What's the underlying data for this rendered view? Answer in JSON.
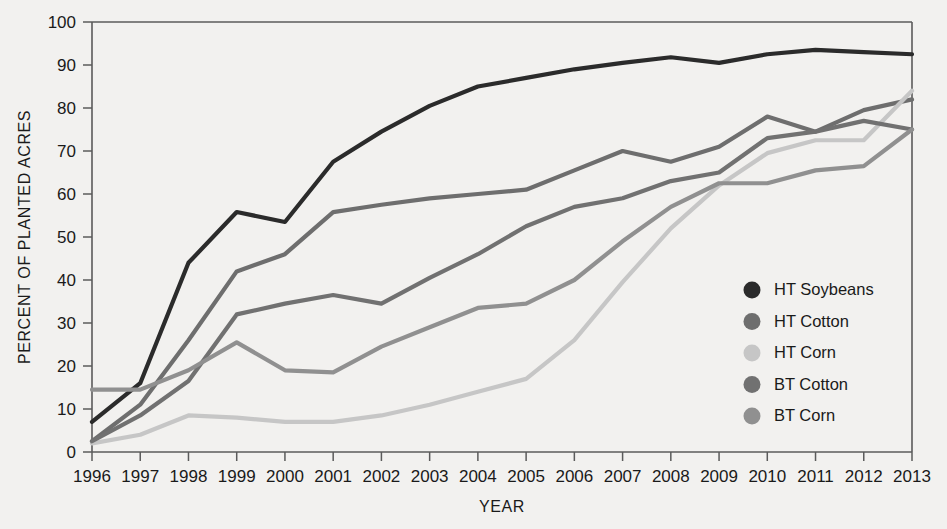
{
  "chart_data": {
    "type": "line",
    "title": "",
    "xlabel": "YEAR",
    "ylabel": "PERCENT OF PLANTED ACRES",
    "xlim": [
      1996,
      2013
    ],
    "ylim": [
      0,
      100
    ],
    "grid": false,
    "legend_position": "inside-right",
    "x": [
      1996,
      1997,
      1998,
      1999,
      2000,
      2001,
      2002,
      2003,
      2004,
      2005,
      2006,
      2007,
      2008,
      2009,
      2010,
      2011,
      2012,
      2013
    ],
    "categories": [
      "1996",
      "1997",
      "1998",
      "1999",
      "2000",
      "2001",
      "2002",
      "2003",
      "2004",
      "2005",
      "2006",
      "2007",
      "2008",
      "2009",
      "2010",
      "2011",
      "2012",
      "2013"
    ],
    "yticks": [
      0,
      10,
      20,
      30,
      40,
      50,
      60,
      70,
      80,
      90,
      100
    ],
    "ytick_labels": [
      "0",
      "10",
      "20",
      "30",
      "40",
      "50",
      "60",
      "70",
      "80",
      "90",
      "100"
    ],
    "series": [
      {
        "name": "HT Soybeans",
        "color": "#2b2b2b",
        "values": [
          7.0,
          16.0,
          44.0,
          55.8,
          53.5,
          67.5,
          74.5,
          80.5,
          85.0,
          87.0,
          89.0,
          90.5,
          91.8,
          90.5,
          92.5,
          93.5,
          93.0,
          92.5
        ]
      },
      {
        "name": "HT Cotton",
        "color": "#6e6e6e",
        "values": [
          2.5,
          11.0,
          26.0,
          42.0,
          46.0,
          55.8,
          57.5,
          59.0,
          60.0,
          61.0,
          65.5,
          70.0,
          67.5,
          71.0,
          78.0,
          74.5,
          79.5,
          82.0
        ]
      },
      {
        "name": "HT Corn",
        "color": "#c6c6c6",
        "values": [
          2.0,
          4.0,
          8.5,
          8.0,
          7.0,
          7.0,
          8.5,
          11.0,
          14.0,
          17.0,
          26.0,
          39.5,
          52.0,
          62.0,
          69.5,
          72.5,
          72.5,
          84.0
        ]
      },
      {
        "name": "BT Cotton",
        "color": "#717171",
        "values": [
          2.5,
          8.5,
          16.5,
          32.0,
          34.5,
          36.5,
          34.5,
          40.5,
          46.0,
          52.5,
          57.0,
          59.0,
          63.0,
          65.0,
          73.0,
          74.5,
          77.0,
          75.0
        ]
      },
      {
        "name": "BT Corn",
        "color": "#909090",
        "values": [
          14.5,
          14.5,
          19.0,
          25.5,
          19.0,
          18.5,
          24.5,
          29.0,
          33.5,
          34.5,
          40.0,
          49.0,
          57.0,
          62.5,
          62.5,
          65.5,
          66.5,
          75.0
        ]
      }
    ]
  },
  "axes": {
    "y_title": "PERCENT OF PLANTED ACRES",
    "x_title": "YEAR"
  },
  "legend": {
    "items": [
      {
        "label": "HT Soybeans",
        "color": "#2b2b2b"
      },
      {
        "label": "HT Cotton",
        "color": "#6e6e6e"
      },
      {
        "label": "HT Corn",
        "color": "#c6c6c6"
      },
      {
        "label": "BT Cotton",
        "color": "#717171"
      },
      {
        "label": "BT Corn",
        "color": "#909090"
      }
    ]
  }
}
